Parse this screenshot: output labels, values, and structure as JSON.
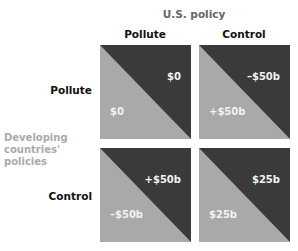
{
  "title": "U.S. policy",
  "columns": [
    "Pollute",
    "Control"
  ],
  "rows": [
    "Pollute",
    "Control"
  ],
  "row_axis_label": [
    "Developing",
    "countries'",
    "policies"
  ],
  "colors": {
    "dark": "#3a3a3a",
    "light": "#a9a9a9",
    "axis_label": "#aaaaaa"
  },
  "cells": [
    {
      "row": "Pollute",
      "col": "Pollute",
      "us_payoff": "$0",
      "developing_payoff": "$0"
    },
    {
      "row": "Pollute",
      "col": "Control",
      "us_payoff": "–$50b",
      "developing_payoff": "+$50b"
    },
    {
      "row": "Control",
      "col": "Pollute",
      "us_payoff": "+$50b",
      "developing_payoff": "–$50b"
    },
    {
      "row": "Control",
      "col": "Control",
      "us_payoff": "$25b",
      "developing_payoff": "$25b"
    }
  ]
}
